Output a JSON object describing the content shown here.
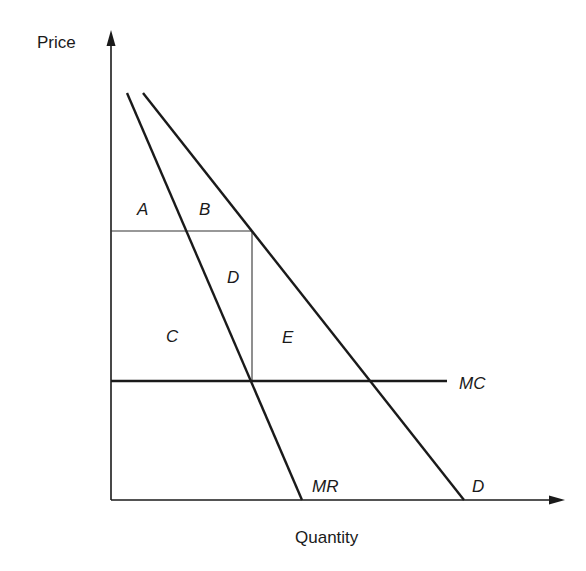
{
  "diagram": {
    "type": "monopoly-pricing",
    "axes": {
      "y_label": "Price",
      "x_label": "Quantity"
    },
    "curves": {
      "mr_label": "MR",
      "d_label": "D",
      "mc_label": "MC"
    },
    "regions": {
      "a": "A",
      "b": "B",
      "c": "C",
      "d": "D",
      "e": "E"
    },
    "colors": {
      "ink": "#1a1a1a",
      "background": "#ffffff"
    }
  }
}
